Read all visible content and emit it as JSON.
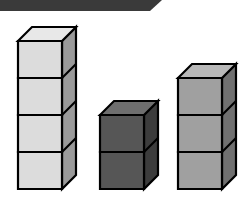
{
  "scene": {
    "title": "Cube Towers",
    "background_color": "#ffffff",
    "outline_color": "#000000",
    "canvas": {
      "width": 243,
      "height": 197
    }
  },
  "top_bar": {
    "name": "top-bar",
    "color": "#3a3a3a",
    "left": 0,
    "top": 0,
    "width": 162,
    "height": 11,
    "taper": 12
  },
  "chart_data": {
    "type": "bar",
    "categories": [
      "Tower 1",
      "Tower 2",
      "Tower 3"
    ],
    "values": [
      4,
      2,
      3
    ],
    "xlabel": "",
    "ylabel": "Number of cubes",
    "ylim": [
      0,
      4
    ],
    "grid": false,
    "legend": "none",
    "unit": "cubes",
    "series": [
      {
        "name": "Cube count",
        "values": [
          4,
          2,
          3
        ]
      }
    ]
  },
  "towers": [
    {
      "id": "tower-left",
      "label": "Tower 1",
      "cubes": 4,
      "front_color": "#dcdcdc",
      "top_color": "#e8e8e8",
      "side_color": "#9a9a9a",
      "left": 18,
      "baseline": 189,
      "front_width": 44,
      "cube_height": 37,
      "depth_x": 14,
      "depth_y": 14
    },
    {
      "id": "tower-middle",
      "label": "Tower 2",
      "cubes": 2,
      "front_color": "#565656",
      "top_color": "#6e6e6e",
      "side_color": "#3c3c3c",
      "left": 100,
      "baseline": 189,
      "front_width": 44,
      "cube_height": 37,
      "depth_x": 14,
      "depth_y": 14
    },
    {
      "id": "tower-right",
      "label": "Tower 3",
      "cubes": 3,
      "front_color": "#a0a0a0",
      "top_color": "#b8b8b8",
      "side_color": "#707070",
      "left": 178,
      "baseline": 189,
      "front_width": 44,
      "cube_height": 37,
      "depth_x": 14,
      "depth_y": 14
    }
  ]
}
